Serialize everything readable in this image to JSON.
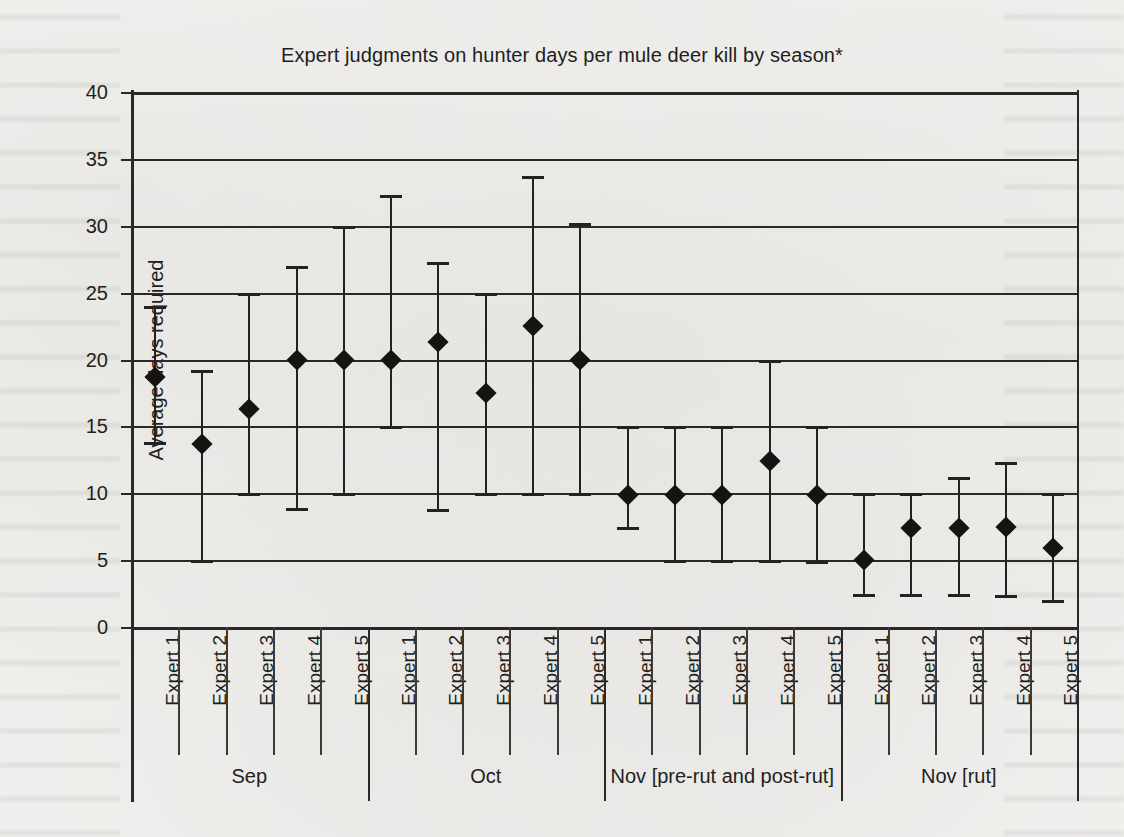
{
  "chart_data": {
    "type": "scatter",
    "title": "Expert judgments on hunter days per mule deer kill by season*",
    "xlabel": "",
    "ylabel": "Average days required",
    "ylim": [
      0,
      40
    ],
    "yticks": [
      40,
      35,
      30,
      25,
      20,
      15,
      10,
      5,
      0
    ],
    "grid": true,
    "legend": "none",
    "marker": "filled diamond with vertical range bars (min/max whiskers)",
    "categories": [
      "Expert 1",
      "Expert 2",
      "Expert 3",
      "Expert 4",
      "Expert 5",
      "Expert 1",
      "Expert 2",
      "Expert 3",
      "Expert 4",
      "Expert 5",
      "Expert 1",
      "Expert 2",
      "Expert 3",
      "Expert 4",
      "Expert 5",
      "Expert 1",
      "Expert 2",
      "Expert 3",
      "Expert 4",
      "Expert 5"
    ],
    "groups": [
      {
        "label": "Sep",
        "start": 0,
        "count": 5
      },
      {
        "label": "Oct",
        "start": 5,
        "count": 5
      },
      {
        "label": "Nov [pre-rut and post-rut]",
        "start": 10,
        "count": 5
      },
      {
        "label": "Nov [rut]",
        "start": 15,
        "count": 5
      }
    ],
    "values": [
      18.7,
      13.7,
      16.3,
      20.0,
      20.0,
      20.0,
      21.3,
      17.5,
      22.5,
      20.0,
      9.9,
      9.9,
      9.9,
      12.4,
      9.9,
      5.0,
      7.4,
      7.4,
      7.5,
      5.9
    ],
    "low": [
      13.8,
      5.0,
      10.0,
      8.9,
      10.0,
      15.0,
      8.8,
      10.0,
      10.0,
      10.0,
      7.5,
      5.0,
      5.0,
      5.0,
      4.9,
      2.5,
      2.5,
      2.5,
      2.4,
      2.0
    ],
    "high": [
      24.0,
      19.2,
      25.0,
      27.0,
      30.0,
      32.3,
      27.3,
      25.0,
      33.7,
      30.2,
      15.0,
      15.0,
      15.0,
      20.0,
      15.0,
      10.0,
      10.0,
      11.2,
      12.3,
      10.0
    ],
    "series": [
      {
        "name": "Average days required",
        "values": [
          18.7,
          13.7,
          16.3,
          20.0,
          20.0,
          20.0,
          21.3,
          17.5,
          22.5,
          20.0,
          9.9,
          9.9,
          9.9,
          12.4,
          9.9,
          5.0,
          7.4,
          7.4,
          7.5,
          5.9
        ]
      }
    ]
  }
}
